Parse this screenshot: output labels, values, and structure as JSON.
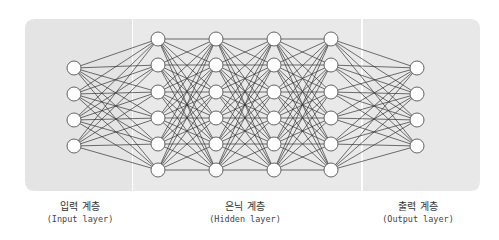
{
  "layers": [
    {
      "name": "input",
      "label_ko": "입력 계층",
      "label_en": "(Input layer)",
      "nodes": 4
    },
    {
      "name": "hidden",
      "label_ko": "은닉 계층",
      "label_en": "(Hidden layer)",
      "nodes": 6,
      "count": 4
    },
    {
      "name": "output",
      "label_ko": "출력 계층",
      "label_en": "(Output layer)",
      "nodes": 4
    }
  ],
  "colors": {
    "panel_input": "#e4e4e4",
    "panel_hidden": "#e9e9e9",
    "panel_output": "#e8e8e8",
    "edge": "#333333",
    "node_fill": "#ffffff",
    "node_stroke": "#555555"
  }
}
